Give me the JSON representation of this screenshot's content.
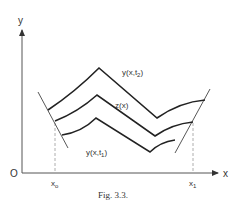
{
  "figure": {
    "caption": "Fig. 3.3.",
    "origin_label": "O",
    "x_axis_label": "x",
    "y_axis_label": "y",
    "x_ticks": [
      {
        "label": "x",
        "sub": "o"
      },
      {
        "label": "x",
        "sub": "1"
      }
    ],
    "curves": [
      {
        "id": "upper",
        "label": "y(x,t",
        "sub": "2",
        "tail": ")"
      },
      {
        "id": "middle",
        "label": "z(x)"
      },
      {
        "id": "lower",
        "label": "y(x,t",
        "sub": "1",
        "tail": ")"
      }
    ],
    "colors": {
      "ink": "#333333",
      "dashed": "#999999",
      "background": "#ffffff"
    }
  }
}
